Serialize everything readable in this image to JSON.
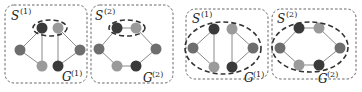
{
  "colors": {
    "dark_node": "#3a3a3a",
    "mid_node": "#6e6e6e",
    "light_node": "#9a9a9a",
    "edge": "#8a8a8a"
  },
  "panels": [
    {
      "group": "left",
      "subgraphs": [
        {
          "s_label": "S",
          "s_sup": "(1)",
          "g_label": "G",
          "g_sup": "(1)",
          "selection": "top-pair"
        },
        {
          "s_label": "S",
          "s_sup": "(2)",
          "g_label": "G",
          "g_sup": "(2)",
          "selection": "top-pair"
        }
      ]
    },
    {
      "group": "right",
      "subgraphs": [
        {
          "s_label": "S",
          "s_sup": "(1)",
          "g_label": "G",
          "g_sup": "(1)",
          "selection": "whole-graph"
        },
        {
          "s_label": "S",
          "s_sup": "(2)",
          "g_label": "G",
          "g_sup": "(2)",
          "selection": "whole-graph"
        }
      ]
    }
  ]
}
